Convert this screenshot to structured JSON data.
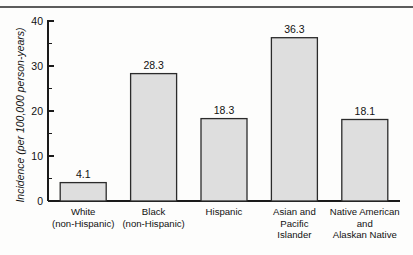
{
  "chart_data": {
    "type": "bar",
    "title": "",
    "xlabel": "",
    "ylabel": "Incidence (per 100,000 person-years)",
    "ylim": [
      0,
      40
    ],
    "grid": false,
    "legend": "none",
    "y_major_ticks": [
      0,
      10,
      20,
      30,
      40
    ],
    "y_minor_ticks": [
      5,
      15,
      25,
      35
    ],
    "y_tick_labels": [
      "0",
      "10",
      "20",
      "30",
      "40"
    ],
    "categories": [
      "White (non-Hispanic)",
      "Black (non-Hispanic)",
      "Hispanic",
      "Asian and Pacific Islander",
      "Native American and Alaskan Native"
    ],
    "category_label_lines": [
      [
        "White",
        "(non-Hispanic)"
      ],
      [
        "Black",
        "(non-Hispanic)"
      ],
      [
        "Hispanic"
      ],
      [
        "Asian and",
        "Pacific",
        "Islander"
      ],
      [
        "Native American",
        "and",
        "Alaskan Native"
      ]
    ],
    "values": [
      4.1,
      28.3,
      18.3,
      36.3,
      18.1
    ],
    "value_labels": [
      "4.1",
      "28.3",
      "18.3",
      "36.3",
      "18.1"
    ],
    "bar_fill_color": "#dedede",
    "bar_edge_color": "#2b2b2b",
    "axis_color": "#1a1a1a"
  },
  "figure": {
    "top_rule_color": "#5c5c5c",
    "background_color": "#fdfdfc"
  }
}
